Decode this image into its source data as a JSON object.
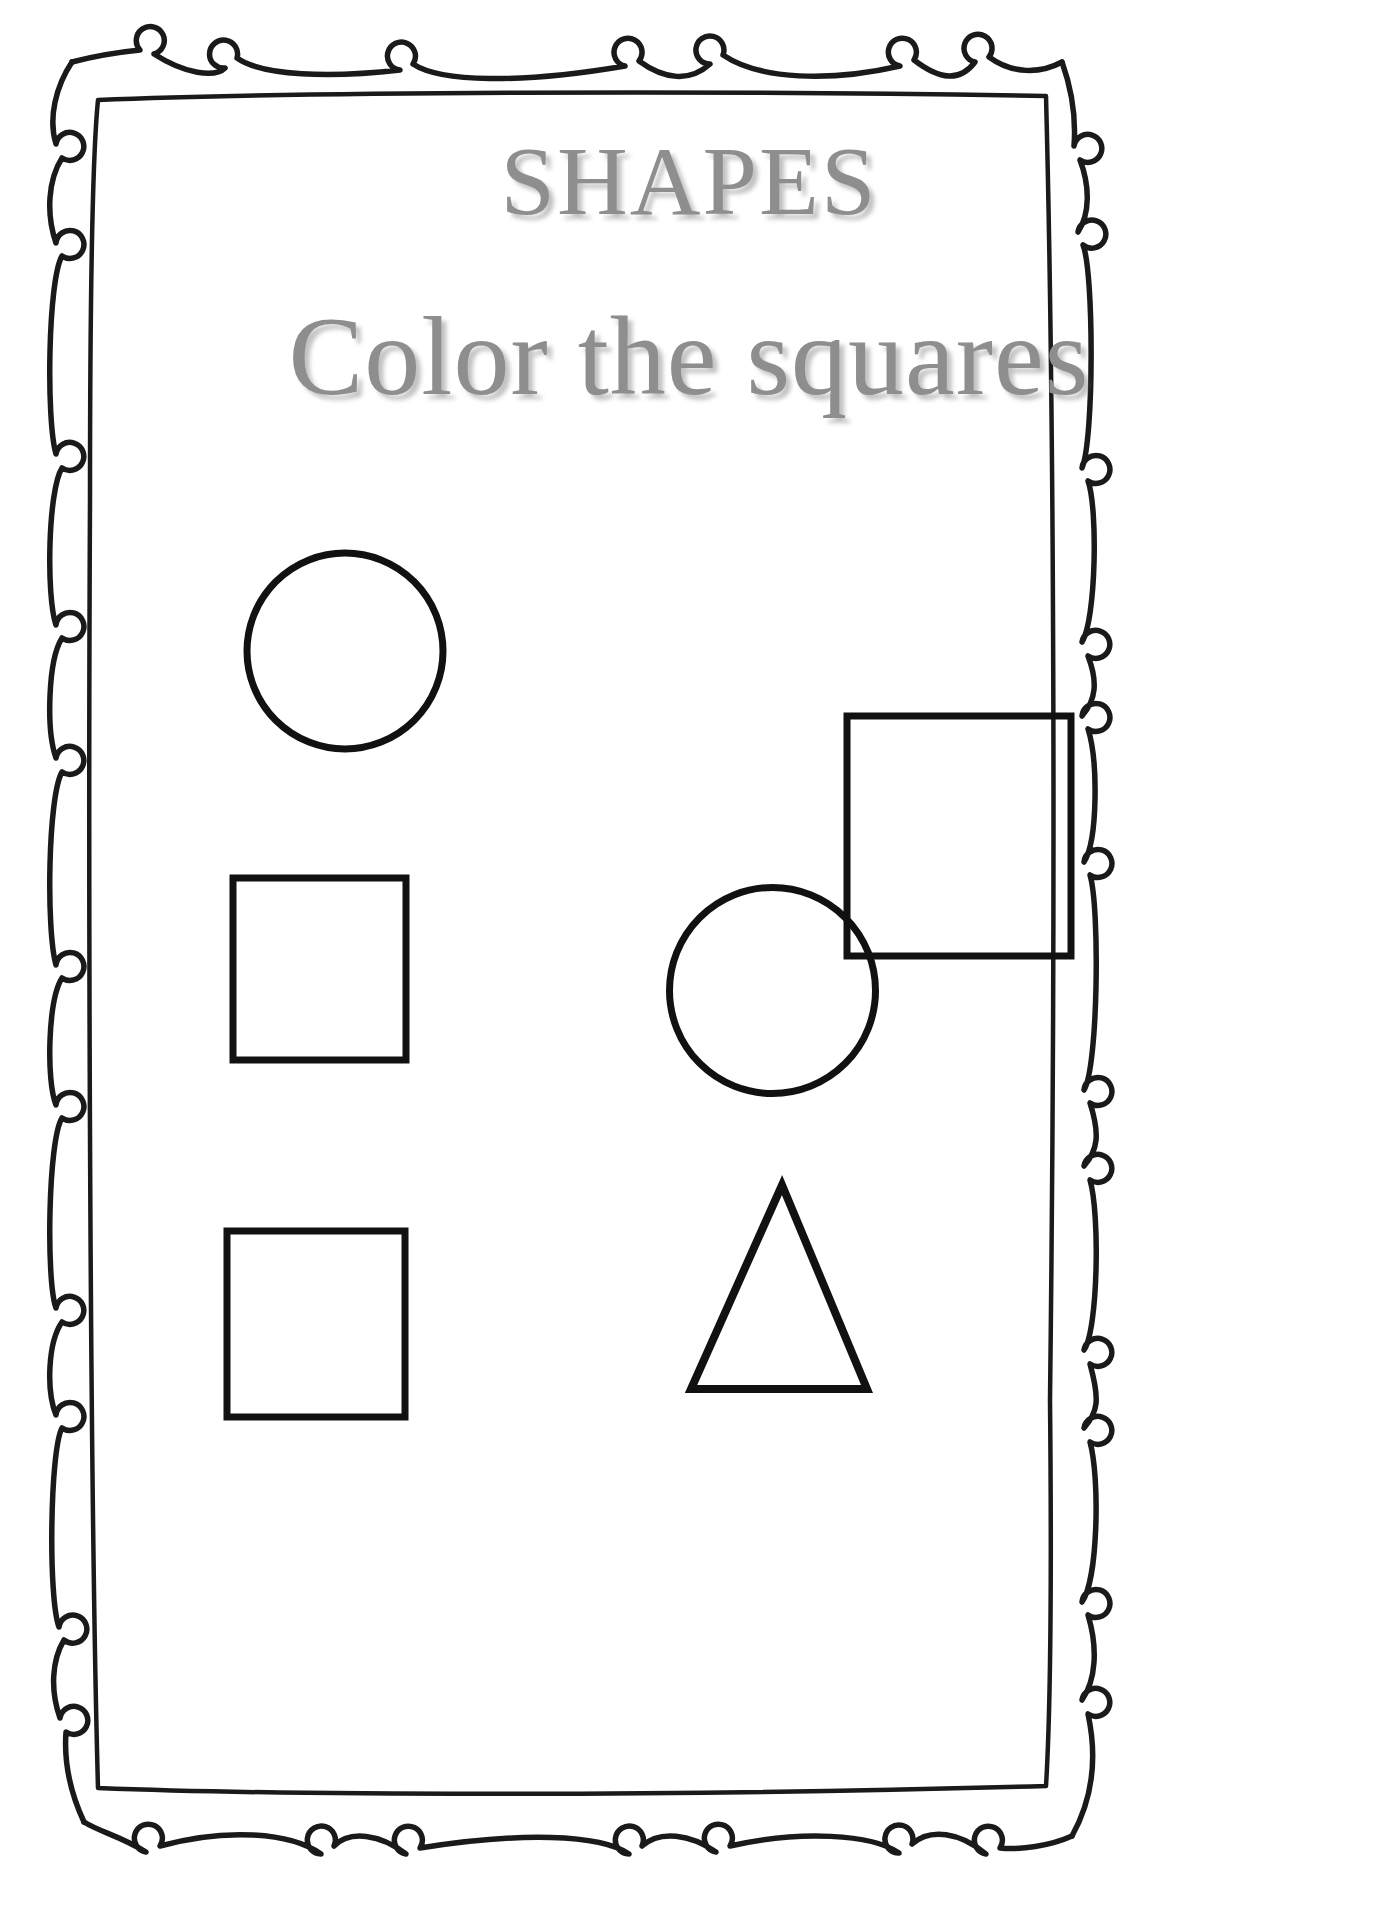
{
  "page": {
    "width": 1378,
    "height": 1920,
    "background": "#ffffff",
    "type": "printable-worksheet"
  },
  "header": {
    "title": "SHAPES",
    "subtitle": "Color the squares",
    "title_color": "#8e8e8e",
    "subtitle_color": "#8e8e8e",
    "has_drop_shadow": true
  },
  "border": {
    "style": "hand-drawn-doodle-double-frame",
    "stroke_color": "#1a1a1a",
    "loop_count_top": 8,
    "loop_count_bottom": 8,
    "loop_count_left": 9,
    "loop_count_right": 9,
    "description": "outer wavy line with small circular curls, inner plain rectangle"
  },
  "instruction": {
    "action": "color",
    "target_shape": "square"
  },
  "shapes": [
    {
      "id": "shape-1",
      "name": "circle",
      "row": 1,
      "column": "left",
      "is_target": false,
      "stroke_color": "#111111",
      "fill": "none",
      "geometry": {
        "cx": 345,
        "cy": 650,
        "r": 98
      }
    },
    {
      "id": "shape-2",
      "name": "square",
      "row": 1,
      "column": "right",
      "is_target": true,
      "stroke_color": "#111111",
      "fill": "none",
      "geometry": {
        "x": 847,
        "y": 716,
        "width": 224,
        "height": 240
      }
    },
    {
      "id": "shape-3",
      "name": "square",
      "row": 2,
      "column": "left",
      "is_target": true,
      "stroke_color": "#111111",
      "fill": "none",
      "geometry": {
        "x": 233,
        "y": 878,
        "width": 173,
        "height": 182
      }
    },
    {
      "id": "shape-4",
      "name": "circle",
      "row": 2,
      "column": "right",
      "is_target": false,
      "stroke_color": "#111111",
      "fill": "none",
      "geometry": {
        "cx": 772,
        "cy": 990,
        "r": 103
      }
    },
    {
      "id": "shape-5",
      "name": "square",
      "row": 3,
      "column": "left",
      "is_target": true,
      "stroke_color": "#111111",
      "fill": "none",
      "geometry": {
        "x": 227,
        "y": 1231,
        "width": 178,
        "height": 186
      }
    },
    {
      "id": "shape-6",
      "name": "triangle",
      "row": 3,
      "column": "right",
      "is_target": false,
      "stroke_color": "#111111",
      "fill": "none",
      "geometry": {
        "apex_x": 782,
        "apex_y": 1181,
        "base_left_x": 691,
        "base_right_x": 866,
        "base_y": 1389
      }
    }
  ],
  "counts": {
    "total_shapes": 6,
    "squares": 3,
    "circles": 2,
    "triangles": 1
  }
}
